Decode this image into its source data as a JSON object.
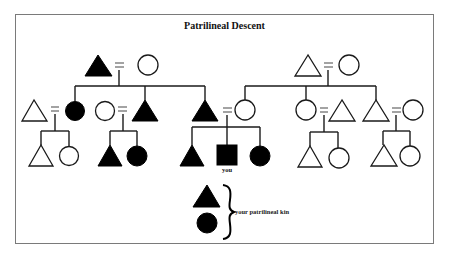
{
  "diagram": {
    "title": "Patrilineal Descent",
    "ego_label": "you",
    "legend": {
      "label": "your patrilineal kin",
      "symbols": [
        "filled-triangle-male",
        "filled-circle-female"
      ]
    },
    "symbol_key": {
      "triangle": "male",
      "circle": "female",
      "square": "ego",
      "filled": "patrilineal kin of ego",
      "equals": "marriage"
    },
    "colors": {
      "filled": "#000000",
      "outline": "#1a1a1a",
      "frame": "#7a7a7a",
      "background": "#ffffff"
    },
    "generations": {
      "grandparents": [
        {
          "husband": {
            "shape": "triangle",
            "filled": true
          },
          "wife": {
            "shape": "circle",
            "filled": false
          },
          "side": "paternal"
        },
        {
          "husband": {
            "shape": "triangle",
            "filled": false
          },
          "wife": {
            "shape": "circle",
            "filled": false
          },
          "side": "maternal"
        }
      ],
      "parents_generation": [
        {
          "couple": [
            {
              "shape": "triangle",
              "filled": false
            },
            {
              "shape": "circle",
              "filled": true
            }
          ],
          "children": [
            {
              "shape": "triangle",
              "filled": false
            },
            {
              "shape": "circle",
              "filled": false
            }
          ]
        },
        {
          "couple": [
            {
              "shape": "circle",
              "filled": false
            },
            {
              "shape": "triangle",
              "filled": true
            }
          ],
          "children": [
            {
              "shape": "triangle",
              "filled": true
            },
            {
              "shape": "circle",
              "filled": true
            }
          ]
        },
        {
          "couple": [
            {
              "shape": "triangle",
              "filled": true
            },
            {
              "shape": "circle",
              "filled": false
            }
          ],
          "children": [
            {
              "shape": "triangle",
              "filled": true
            },
            {
              "shape": "square",
              "filled": true,
              "label": "you"
            },
            {
              "shape": "circle",
              "filled": true
            }
          ]
        },
        {
          "couple": [
            {
              "shape": "circle",
              "filled": false
            },
            {
              "shape": "triangle",
              "filled": false
            }
          ],
          "children": [
            {
              "shape": "triangle",
              "filled": false
            },
            {
              "shape": "circle",
              "filled": false
            }
          ]
        },
        {
          "couple": [
            {
              "shape": "triangle",
              "filled": false
            },
            {
              "shape": "circle",
              "filled": false
            }
          ],
          "children": [
            {
              "shape": "triangle",
              "filled": false
            },
            {
              "shape": "circle",
              "filled": false
            }
          ]
        }
      ]
    }
  }
}
